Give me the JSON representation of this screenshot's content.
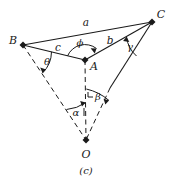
{
  "figure": {
    "caption": "(c)",
    "vertices": [
      {
        "name": "B",
        "label": "B",
        "x": 23,
        "y": 45,
        "label_x": 13,
        "label_y": 40
      },
      {
        "name": "C",
        "label": "C",
        "x": 152,
        "y": 22,
        "label_x": 161,
        "label_y": 14
      },
      {
        "name": "A",
        "label": "A",
        "x": 85,
        "y": 60,
        "label_x": 94,
        "label_y": 66
      },
      {
        "name": "O",
        "label": "O",
        "x": 86,
        "y": 140,
        "label_x": 86,
        "label_y": 154
      }
    ],
    "side_labels": [
      {
        "name": "a",
        "label": "a",
        "x": 86,
        "y": 22
      },
      {
        "name": "b",
        "label": "b",
        "x": 110,
        "y": 40
      },
      {
        "name": "c",
        "label": "c",
        "x": 58,
        "y": 47
      }
    ],
    "angle_labels": [
      {
        "name": "phi",
        "label": "ϕ",
        "x": 80,
        "y": 43
      },
      {
        "name": "theta",
        "label": "θ",
        "x": 47,
        "y": 62
      },
      {
        "name": "gamma",
        "label": "γ",
        "x": 130,
        "y": 47
      },
      {
        "name": "alpha",
        "label": "α",
        "x": 76,
        "y": 113
      },
      {
        "name": "beta",
        "label": "β",
        "x": 98,
        "y": 97
      }
    ],
    "colors": {
      "stroke": "#1a1a1a",
      "background": "#ffffff"
    }
  }
}
